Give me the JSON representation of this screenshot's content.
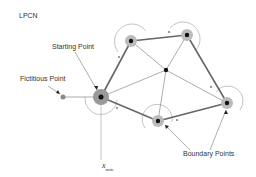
{
  "title": "LPCN",
  "labels": {
    "starting_point": "Starting Point",
    "fictitious_point": "Fictitious Point",
    "boundary_points": "Boundary Points",
    "xmin_main": "x",
    "xmin_sub": "min"
  },
  "nodes": [
    {
      "id": "start",
      "x": 101,
      "y": 97,
      "type": "starting"
    },
    {
      "id": "top-left",
      "x": 131,
      "y": 41,
      "type": "boundary"
    },
    {
      "id": "top-right",
      "x": 187,
      "y": 35,
      "type": "boundary"
    },
    {
      "id": "center",
      "x": 166,
      "y": 70,
      "type": "interior"
    },
    {
      "id": "right",
      "x": 227,
      "y": 103,
      "type": "boundary"
    },
    {
      "id": "bottom",
      "x": 158,
      "y": 121,
      "type": "boundary"
    },
    {
      "id": "fictitious",
      "x": 63,
      "y": 97,
      "type": "fictitious"
    }
  ],
  "colors": {
    "edge": "#666666",
    "node": "#111111",
    "halo": "#bbbbbb",
    "arc": "#aaaaaa",
    "text": "#333333"
  }
}
